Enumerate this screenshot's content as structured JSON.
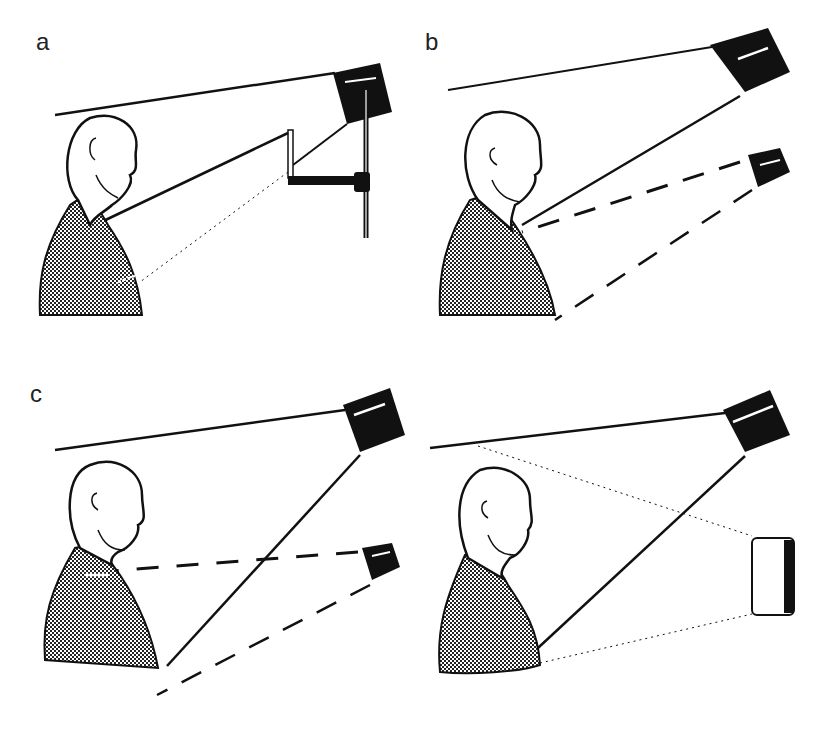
{
  "figure": {
    "panels": [
      {
        "id": "a",
        "label": "a",
        "description": "Projector on stand with mirror on arm, beam reflected to chest of person"
      },
      {
        "id": "b",
        "label": "b",
        "description": "Overhead projector beam to neck; second small camera with dashed beam"
      },
      {
        "id": "c",
        "label": "c",
        "description": "Overhead projector beam to torso; small camera with dashed beam at neck level"
      },
      {
        "id": "d",
        "label": "",
        "description": "Overhead projector beam with dotted lines to rectangular screen/mirror"
      }
    ]
  }
}
